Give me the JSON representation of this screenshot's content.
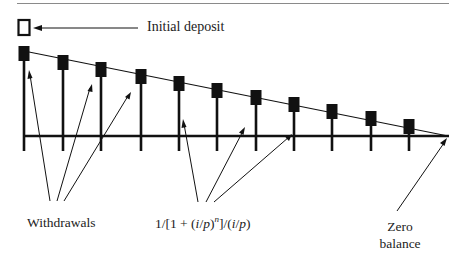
{
  "diagram": {
    "title": "",
    "labels": {
      "initial_deposit": "Initial deposit",
      "withdrawals": "Withdrawals",
      "formula": "1/[1 + (i/p)^n]/(i/p)",
      "formula_parts": {
        "a": "1/[1 + (",
        "i1": "i",
        "b": "/",
        "p1": "p",
        "c": ")",
        "n": "n",
        "d": "]/(",
        "i2": "i",
        "e": "/",
        "p2": "p",
        "f": ")"
      },
      "zero_balance_line1": "Zero",
      "zero_balance_line2": "balance"
    },
    "colors": {
      "ink": "#111111",
      "rule": "#888888",
      "background": "#ffffff"
    },
    "withdrawal_count": 11,
    "withdrawal_bars": [
      {
        "x": 24,
        "top": 46
      },
      {
        "x": 63,
        "top": 55
      },
      {
        "x": 101,
        "top": 62
      },
      {
        "x": 141,
        "top": 69
      },
      {
        "x": 179,
        "top": 76
      },
      {
        "x": 217,
        "top": 83
      },
      {
        "x": 256,
        "top": 90
      },
      {
        "x": 294,
        "top": 97
      },
      {
        "x": 332,
        "top": 104
      },
      {
        "x": 371,
        "top": 111
      },
      {
        "x": 409,
        "top": 119
      }
    ]
  }
}
